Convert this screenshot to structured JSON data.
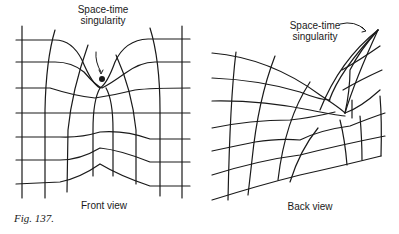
{
  "figure": {
    "caption": "Fig. 137.",
    "panels": [
      {
        "id": "front",
        "title": "Front view",
        "annotation_line1": "Space-time",
        "annotation_line2": "singularity"
      },
      {
        "id": "back",
        "title": "Back view",
        "annotation_line1": "Space-time",
        "annotation_line2": "singularity"
      }
    ],
    "colors": {
      "ink": "#1a1a1a",
      "background": "#ffffff"
    }
  }
}
